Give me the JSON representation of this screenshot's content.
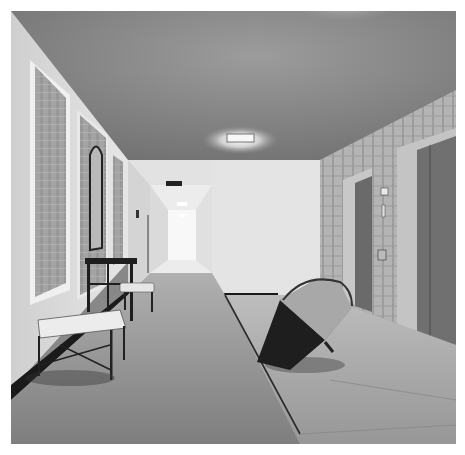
{
  "image": {
    "description": "Black-and-white photograph of a hotel elevator lobby and corridor",
    "colors": {
      "ceiling": "#8a8a8a",
      "ceiling_light": "#f2f2f2",
      "wall_left": "#d9d9d9",
      "wall_back": "#e4e4e4",
      "corridor_end": "#f7f7f7",
      "wallpaper_panel": "#9a9a9a",
      "elevator_door": "#6e6e6e",
      "carpet": "#8c8c8c",
      "tile_floor": "#9d9d9d",
      "umbrella": "#2a2a2a",
      "bench": "#e6e6e6",
      "table": "#1e1e1e",
      "border": "#ffffff"
    },
    "objects": [
      "ceiling-light",
      "framed-wallpaper-panels",
      "arched-mirror",
      "console-table",
      "upholstered-benches",
      "long-corridor",
      "exit-sign",
      "elevator-doors",
      "elevator-call-buttons",
      "open-umbrella",
      "carpet",
      "tile-floor"
    ]
  }
}
